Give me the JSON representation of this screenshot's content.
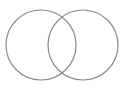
{
  "diagram": {
    "type": "venn",
    "background": "#ffffff",
    "stroke_color": "#8a8a8a",
    "stroke_width": 1.2,
    "circles": [
      {
        "name": "set-a",
        "cx": 41,
        "cy": 45,
        "r": 35
      },
      {
        "name": "set-b",
        "cx": 83,
        "cy": 45,
        "r": 35
      }
    ]
  }
}
